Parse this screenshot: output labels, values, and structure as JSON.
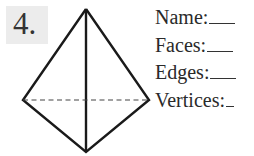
{
  "problem": {
    "number": "4.",
    "shape": "triangular-bipyramid",
    "fields": [
      {
        "label": "Name:",
        "value": ""
      },
      {
        "label": "Faces:",
        "value": ""
      },
      {
        "label": "Edges:",
        "value": ""
      },
      {
        "label": "Vertices:",
        "value": ""
      }
    ]
  }
}
